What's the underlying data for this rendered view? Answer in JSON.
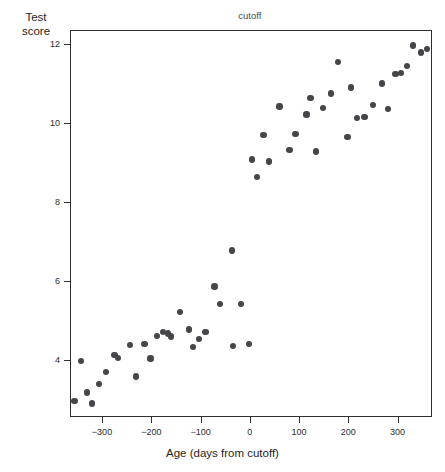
{
  "chart_data": {
    "type": "scatter",
    "title": "",
    "xlabel": "Age (days from cutoff)",
    "ylabel_line1": "Test",
    "ylabel_line2": "score",
    "xlim": [
      -365,
      370
    ],
    "ylim": [
      2.55,
      12.35
    ],
    "xticks": [
      -300,
      -200,
      -100,
      0,
      100,
      200,
      300
    ],
    "xtick_labels": [
      "−300",
      "−200",
      "−100",
      "0",
      "100",
      "200",
      "300"
    ],
    "yticks": [
      4,
      6,
      8,
      10,
      12
    ],
    "ytick_labels": [
      "4",
      "6",
      "8",
      "10",
      "12"
    ],
    "grid": false,
    "legend": null,
    "annotations": [
      {
        "text": "cutoff",
        "x": 0,
        "position": "above-axis"
      }
    ],
    "cutoff": {
      "x": 0,
      "label": "cutoff",
      "style": "dotted",
      "color": "#8d8d92"
    },
    "marker": {
      "shape": "circle",
      "color": "#45454a",
      "size_px": 6.4
    },
    "series": [
      {
        "name": "below cutoff",
        "color": "#45454a",
        "points": [
          [
            -358,
            2.98
          ],
          [
            -345,
            3.99
          ],
          [
            -333,
            3.2
          ],
          [
            -322,
            2.92
          ],
          [
            -308,
            3.41
          ],
          [
            -294,
            3.71
          ],
          [
            -277,
            4.14
          ],
          [
            -270,
            4.07
          ],
          [
            -245,
            4.4
          ],
          [
            -233,
            3.6
          ],
          [
            -216,
            4.42
          ],
          [
            -204,
            4.06
          ],
          [
            -190,
            4.63
          ],
          [
            -178,
            4.73
          ],
          [
            -168,
            4.69
          ],
          [
            -162,
            4.61
          ],
          [
            -144,
            5.23
          ],
          [
            -126,
            4.79
          ],
          [
            -117,
            4.35
          ],
          [
            -105,
            4.55
          ],
          [
            -92,
            4.73
          ],
          [
            -74,
            5.88
          ],
          [
            -63,
            5.44
          ],
          [
            -38,
            6.79
          ],
          [
            -36,
            4.38
          ],
          [
            -20,
            5.43
          ],
          [
            -3,
            4.43
          ]
        ]
      },
      {
        "name": "above cutoff",
        "color": "#45454a",
        "points": [
          [
            2,
            9.1
          ],
          [
            13,
            8.66
          ],
          [
            26,
            9.72
          ],
          [
            37,
            9.05
          ],
          [
            58,
            10.44
          ],
          [
            79,
            9.33
          ],
          [
            91,
            9.74
          ],
          [
            113,
            10.24
          ],
          [
            121,
            10.65
          ],
          [
            133,
            9.3
          ],
          [
            147,
            10.4
          ],
          [
            163,
            10.77
          ],
          [
            177,
            11.57
          ],
          [
            196,
            9.66
          ],
          [
            203,
            10.92
          ],
          [
            216,
            10.15
          ],
          [
            231,
            10.18
          ],
          [
            248,
            10.48
          ],
          [
            267,
            11.02
          ],
          [
            279,
            10.37
          ],
          [
            294,
            11.26
          ],
          [
            305,
            11.28
          ],
          [
            317,
            11.46
          ],
          [
            329,
            11.98
          ],
          [
            345,
            11.81
          ],
          [
            358,
            11.9
          ]
        ]
      }
    ]
  }
}
